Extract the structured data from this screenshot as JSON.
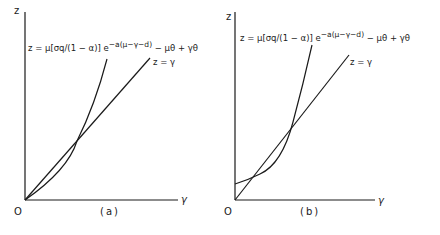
{
  "panels": [
    {
      "id": "a",
      "caption": "(a)",
      "origin_label": "O",
      "x_axis_label": "γ",
      "y_axis_label": "z",
      "curve_equation_main": "z = μ[σq/(1 − α)] e",
      "curve_equation_exponent": "−a(μ−γ−d)",
      "curve_equation_tail": "− μθ + γθ",
      "line_label": "z = γ",
      "description": "Convex curve starts at origin, lies below line z=γ initially, intersects it once"
    },
    {
      "id": "b",
      "caption": "(b)",
      "origin_label": "O",
      "x_axis_label": "γ",
      "y_axis_label": "z",
      "curve_equation_main": "z = μ[σq/(1 − α)] e",
      "curve_equation_exponent": "−a(μ−γ−d)",
      "curve_equation_tail": "− μθ + γθ",
      "line_label": "z = γ",
      "description": "Convex curve starts above origin on z-axis, intersects line z=γ twice"
    }
  ],
  "colors": {
    "ink": "#1a1a1a",
    "background": "#ffffff"
  }
}
